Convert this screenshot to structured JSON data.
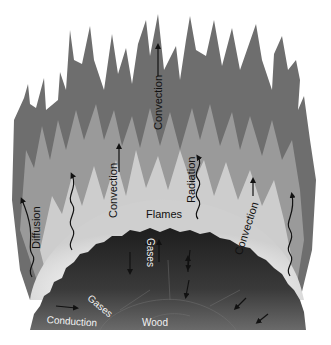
{
  "diagram": {
    "colors": {
      "flame_outer": "#6e6e6e",
      "flame_mid": "#9a9a9a",
      "flame_inner": "#d8d8d8",
      "glow": "#f7f7f7",
      "wood": "#2a2a2a",
      "wood_light": "#5a5a5a",
      "background": "#ffffff"
    },
    "labels": {
      "convection_top": "Convection",
      "convection_left": "Convection",
      "convection_right": "Convection",
      "radiation": "Radiation",
      "diffusion": "Diffusion",
      "flames": "Flames",
      "gases_left": "Gases",
      "gases_center": "Gases",
      "conduction": "Conduction",
      "wood": "Wood"
    },
    "arrows": [
      {
        "name": "convection-top-arrow",
        "type": "straight",
        "direction": "up"
      },
      {
        "name": "convection-left-arrow",
        "type": "straight",
        "direction": "up"
      },
      {
        "name": "convection-right-arrow",
        "type": "straight",
        "direction": "up"
      },
      {
        "name": "radiation-arrow",
        "type": "wavy",
        "direction": "up"
      },
      {
        "name": "diffusion-arrow",
        "type": "wavy",
        "direction": "up"
      },
      {
        "name": "left-wavy-arrow",
        "type": "wavy",
        "direction": "up"
      },
      {
        "name": "right-wavy-arrow",
        "type": "wavy",
        "direction": "up"
      },
      {
        "name": "gas-arrows",
        "type": "straight",
        "direction": "mixed"
      },
      {
        "name": "conduction-arrow",
        "type": "straight",
        "direction": "right"
      }
    ]
  }
}
